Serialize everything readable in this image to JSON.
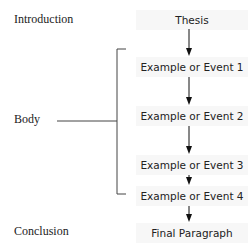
{
  "sections": {
    "introduction": "Introduction",
    "body": "Body",
    "conclusion": "Conclusion"
  },
  "flow": [
    "Thesis",
    "Example or Event 1",
    "Example or Event 2",
    "Example or Event 3",
    "Example or Event 4",
    "Final Paragraph"
  ]
}
